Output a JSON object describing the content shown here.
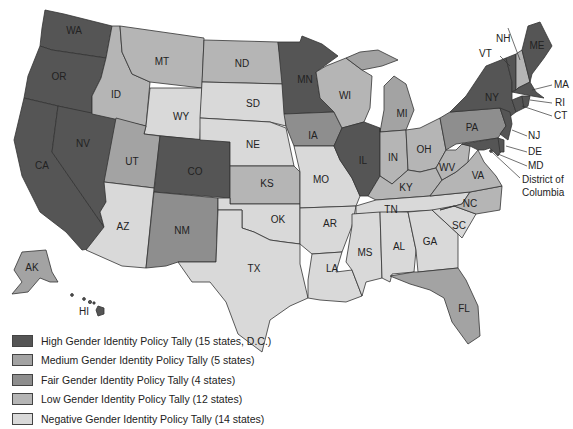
{
  "colors": {
    "high": "#555555",
    "medium": "#a3a3a3",
    "fair": "#8e8e8e",
    "low": "#b5b5b5",
    "negative": "#d9d9d9"
  },
  "legend": [
    {
      "key": "high",
      "label": "High Gender Identity Policy Tally (15 states, D.C.)"
    },
    {
      "key": "medium",
      "label": "Medium Gender Identity Policy Tally (5 states)"
    },
    {
      "key": "fair",
      "label": "Fair Gender Identity Policy Tally (4 states)"
    },
    {
      "key": "low",
      "label": "Low Gender Identity Policy Tally (12 states)"
    },
    {
      "key": "negative",
      "label": "Negative Gender Identity Policy Tally (14 states)"
    }
  ],
  "states": {
    "WA": {
      "label": "WA",
      "tier": "high"
    },
    "OR": {
      "label": "OR",
      "tier": "high"
    },
    "CA": {
      "label": "CA",
      "tier": "high"
    },
    "NV": {
      "label": "NV",
      "tier": "high"
    },
    "ID": {
      "label": "ID",
      "tier": "low"
    },
    "MT": {
      "label": "MT",
      "tier": "low"
    },
    "WY": {
      "label": "WY",
      "tier": "negative"
    },
    "UT": {
      "label": "UT",
      "tier": "medium"
    },
    "CO": {
      "label": "CO",
      "tier": "high"
    },
    "AZ": {
      "label": "AZ",
      "tier": "negative"
    },
    "NM": {
      "label": "NM",
      "tier": "fair"
    },
    "ND": {
      "label": "ND",
      "tier": "low"
    },
    "SD": {
      "label": "SD",
      "tier": "negative"
    },
    "NE": {
      "label": "NE",
      "tier": "negative"
    },
    "KS": {
      "label": "KS",
      "tier": "low"
    },
    "OK": {
      "label": "OK",
      "tier": "negative"
    },
    "TX": {
      "label": "TX",
      "tier": "negative"
    },
    "MN": {
      "label": "MN",
      "tier": "high"
    },
    "IA": {
      "label": "IA",
      "tier": "fair"
    },
    "MO": {
      "label": "MO",
      "tier": "negative"
    },
    "AR": {
      "label": "AR",
      "tier": "negative"
    },
    "LA": {
      "label": "LA",
      "tier": "negative"
    },
    "WI": {
      "label": "WI",
      "tier": "low"
    },
    "IL": {
      "label": "IL",
      "tier": "high"
    },
    "MI": {
      "label": "MI",
      "tier": "medium"
    },
    "IN": {
      "label": "IN",
      "tier": "low"
    },
    "OH": {
      "label": "OH",
      "tier": "low"
    },
    "KY": {
      "label": "KY",
      "tier": "low"
    },
    "TN": {
      "label": "TN",
      "tier": "negative"
    },
    "MS": {
      "label": "MS",
      "tier": "negative"
    },
    "AL": {
      "label": "AL",
      "tier": "negative"
    },
    "GA": {
      "label": "GA",
      "tier": "negative"
    },
    "FL": {
      "label": "FL",
      "tier": "medium"
    },
    "SC": {
      "label": "SC",
      "tier": "negative"
    },
    "NC": {
      "label": "NC",
      "tier": "low"
    },
    "VA": {
      "label": "VA",
      "tier": "low"
    },
    "WV": {
      "label": "WV",
      "tier": "low"
    },
    "PA": {
      "label": "PA",
      "tier": "fair"
    },
    "NY": {
      "label": "NY",
      "tier": "high"
    },
    "NJ": {
      "label": "NJ",
      "tier": "high"
    },
    "DE": {
      "label": "DE",
      "tier": "high"
    },
    "MD": {
      "label": "MD",
      "tier": "high"
    },
    "DC": {
      "label": "District of Columbia",
      "label_line1": "District of",
      "label_line2": "Columbia",
      "tier": "high"
    },
    "CT": {
      "label": "CT",
      "tier": "high"
    },
    "RI": {
      "label": "RI",
      "tier": "high"
    },
    "MA": {
      "label": "MA",
      "tier": "high"
    },
    "VT": {
      "label": "VT",
      "tier": "high"
    },
    "NH": {
      "label": "NH",
      "tier": "low"
    },
    "ME": {
      "label": "ME",
      "tier": "high"
    },
    "AK": {
      "label": "AK",
      "tier": "medium"
    },
    "HI": {
      "label": "HI",
      "tier": "high"
    }
  }
}
